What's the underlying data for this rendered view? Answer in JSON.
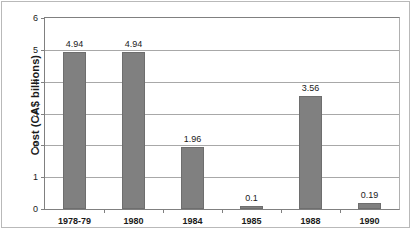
{
  "chart_data": {
    "type": "bar",
    "title": "",
    "subtitle": "",
    "xlabel": "",
    "ylabel": "Cost (CA$ billions)",
    "categories": [
      "1978-79",
      "1980",
      "1984",
      "1985",
      "1988",
      "1990"
    ],
    "values": [
      4.94,
      4.94,
      1.96,
      0.1,
      3.56,
      0.19
    ],
    "value_labels": [
      "4.94",
      "4.94",
      "1.96",
      "0.1",
      "3.56",
      "0.19"
    ],
    "series": [
      {
        "name": "Cost",
        "values": [
          4.94,
          4.94,
          1.96,
          0.1,
          3.56,
          0.19
        ]
      }
    ],
    "ylim": [
      0,
      6
    ],
    "yticks": [
      0,
      1,
      2,
      3,
      4,
      5,
      6
    ],
    "ytick_labels": [
      "0",
      "1",
      "2",
      "3",
      "4",
      "5",
      "6"
    ],
    "grid": true,
    "grid_axis": "y",
    "legend": false,
    "legend_position": "none",
    "bar_color": "#808080",
    "bar_edge_color": "#6e6e6e",
    "grid_color": "#a8a8a8",
    "axis_color": "#808080",
    "text_color": "#1a1a1a",
    "background": "#ffffff"
  }
}
